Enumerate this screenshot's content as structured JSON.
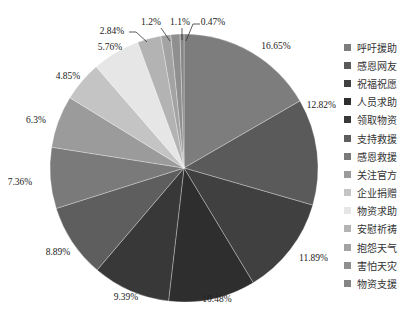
{
  "chart_data": {
    "type": "pie",
    "title": "",
    "start_angle_deg": 0,
    "direction": "clockwise",
    "legend_position": "right",
    "slices": [
      {
        "label": "呼吁援助",
        "value": 16.65,
        "display": "16.65%",
        "color": "#7d7d7d"
      },
      {
        "label": "感恩网友",
        "value": 12.82,
        "display": "12.82%",
        "color": "#5a5a5a"
      },
      {
        "label": "祝福祝愿",
        "value": 11.89,
        "display": "11.89%",
        "color": "#404040"
      },
      {
        "label": "人员求助",
        "value": 10.48,
        "display": "10.48%",
        "color": "#2e2e2e"
      },
      {
        "label": "领取物资",
        "value": 9.39,
        "display": "9.39%",
        "color": "#383838"
      },
      {
        "label": "支持救援",
        "value": 8.89,
        "display": "8.89%",
        "color": "#5e5e5e"
      },
      {
        "label": "感恩救援",
        "value": 7.36,
        "display": "7.36%",
        "color": "#7a7a7a"
      },
      {
        "label": "关注官方",
        "value": 6.3,
        "display": "6.3%",
        "color": "#9b9b9b"
      },
      {
        "label": "企业捐赠",
        "value": 4.85,
        "display": "4.85%",
        "color": "#c4c4c4"
      },
      {
        "label": "物资求助",
        "value": 5.76,
        "display": "5.76%",
        "color": "#e6e6e6"
      },
      {
        "label": "安慰祈祷",
        "value": 2.84,
        "display": "2.84%",
        "color": "#b3b3b3"
      },
      {
        "label": "抱怨天气",
        "value": 1.2,
        "display": "1.2%",
        "color": "#a3a3a3"
      },
      {
        "label": "害怕天灾",
        "value": 1.1,
        "display": "1.1%",
        "color": "#8f8f8f"
      },
      {
        "label": "物资支援",
        "value": 0.47,
        "display": "0.47%",
        "color": "#858585"
      }
    ]
  },
  "legend": {
    "items": [
      {
        "label": "呼吁援助",
        "color": "#7d7d7d"
      },
      {
        "label": "感恩网友",
        "color": "#5a5a5a"
      },
      {
        "label": "祝福祝愿",
        "color": "#404040"
      },
      {
        "label": "人员求助",
        "color": "#2e2e2e"
      },
      {
        "label": "领取物资",
        "color": "#383838"
      },
      {
        "label": "支持救援",
        "color": "#5e5e5e"
      },
      {
        "label": "感恩救援",
        "color": "#7a7a7a"
      },
      {
        "label": "关注官方",
        "color": "#9b9b9b"
      },
      {
        "label": "企业捐赠",
        "color": "#c4c4c4"
      },
      {
        "label": "物资求助",
        "color": "#e6e6e6"
      },
      {
        "label": "安慰祈祷",
        "color": "#b3b3b3"
      },
      {
        "label": "抱怨天气",
        "color": "#a3a3a3"
      },
      {
        "label": "害怕天灾",
        "color": "#8f8f8f"
      },
      {
        "label": "物资支援",
        "color": "#858585"
      }
    ]
  }
}
